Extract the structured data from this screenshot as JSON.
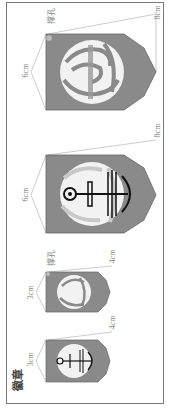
{
  "title": "徽章",
  "colors": {
    "badge_fill": "#8a8a8a",
    "emblem": "#f2f2f2",
    "outline": "#999999",
    "ink": "#111111",
    "frame": "#777777"
  },
  "badges": [
    {
      "id": "small-anchor",
      "width_label": "3cm",
      "height_label": "4cm",
      "emblem": "anchor"
    },
    {
      "id": "small-swirl",
      "width_label": "3cm",
      "height_label": "4cm",
      "hole_label": "撑孔",
      "emblem": "swirl"
    },
    {
      "id": "large-anchor",
      "width_label": "6cm",
      "height_label": "8cm",
      "emblem": "anchor"
    },
    {
      "id": "large-swirl",
      "width_label": "6cm",
      "height_label": "8cm",
      "hole_label": "撑孔",
      "emblem": "swirl"
    }
  ]
}
